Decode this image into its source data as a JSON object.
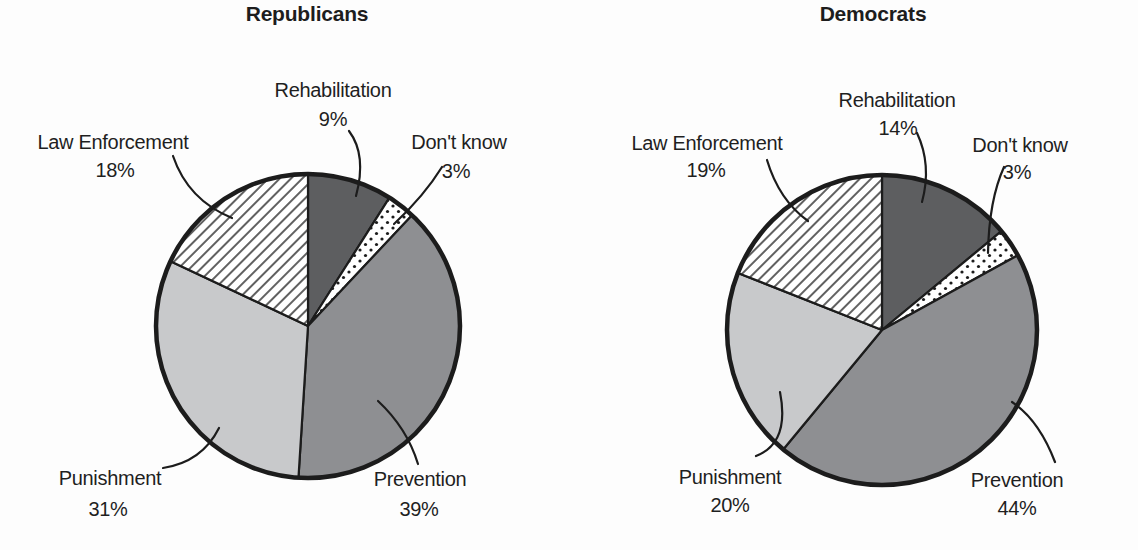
{
  "figure": {
    "background": "#fdfdfd"
  },
  "colors": {
    "dark_gray": "#5d5e60",
    "medium_gray": "#8e8f92",
    "light_gray": "#c8c9cb",
    "pattern_background": "#ffffff",
    "ink": "#1c1c1c",
    "text": "#1f1f1f"
  },
  "chart_data": [
    {
      "type": "pie",
      "title": "Republicans",
      "start_angle_deg": 0,
      "direction": "clockwise",
      "legend": "none",
      "labels": "outside-with-leader-lines",
      "slices": [
        {
          "label": "Rehabilitation",
          "value": 9,
          "display": "9%",
          "fill": "dark_gray"
        },
        {
          "label": "Don't know",
          "value": 3,
          "display": "3%",
          "fill": "dots"
        },
        {
          "label": "Prevention",
          "value": 39,
          "display": "39%",
          "fill": "medium_gray"
        },
        {
          "label": "Punishment",
          "value": 31,
          "display": "31%",
          "fill": "light_gray"
        },
        {
          "label": "Law Enforcement",
          "value": 18,
          "display": "18%",
          "fill": "diagonal_hatch"
        }
      ]
    },
    {
      "type": "pie",
      "title": "Democrats",
      "start_angle_deg": 0,
      "direction": "clockwise",
      "legend": "none",
      "labels": "outside-with-leader-lines",
      "slices": [
        {
          "label": "Rehabilitation",
          "value": 14,
          "display": "14%",
          "fill": "dark_gray"
        },
        {
          "label": "Don't know",
          "value": 3,
          "display": "3%",
          "fill": "dots"
        },
        {
          "label": "Prevention",
          "value": 44,
          "display": "44%",
          "fill": "medium_gray"
        },
        {
          "label": "Punishment",
          "value": 20,
          "display": "20%",
          "fill": "light_gray"
        },
        {
          "label": "Law Enforcement",
          "value": 19,
          "display": "19%",
          "fill": "diagonal_hatch"
        }
      ]
    }
  ]
}
